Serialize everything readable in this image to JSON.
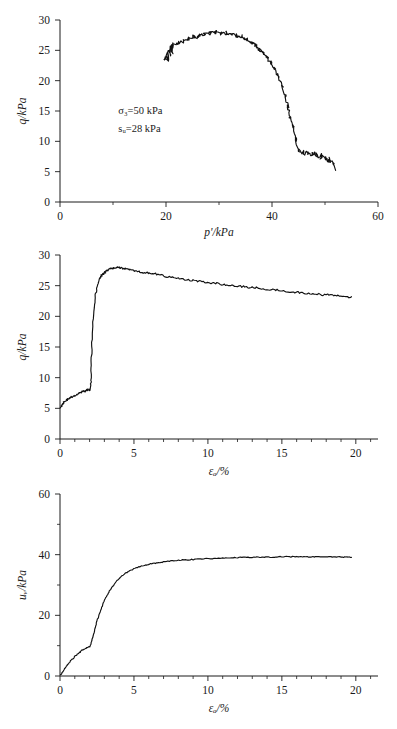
{
  "figure": {
    "name": "triaxial-test-results",
    "panel_count": 3
  },
  "chart_data": [
    {
      "id": "stress-path",
      "type": "line",
      "title": "",
      "xlabel": "p'/kPa",
      "ylabel": "q/kPa",
      "xlim": [
        0,
        60
      ],
      "ylim": [
        0,
        30
      ],
      "xticks": [
        0,
        20,
        40,
        60
      ],
      "xticks_minor": [
        10,
        30,
        50
      ],
      "yticks": [
        0,
        5,
        10,
        15,
        20,
        25,
        30
      ],
      "grid": false,
      "legend": "none",
      "annotations": [
        {
          "text": "σ₃=50 kPa",
          "x": 11,
          "y": 14.5
        },
        {
          "text": "sᵤ=28 kPa",
          "x": 11,
          "y": 11.5
        }
      ],
      "series": [
        {
          "name": "effective stress path",
          "x": [
            19.6,
            19.9,
            20.3,
            20.1,
            20.6,
            20.4,
            21.0,
            20.7,
            21.3,
            21.1,
            21.0,
            20.6,
            20.9,
            21.4,
            21.2,
            21.8,
            22.4,
            22.1,
            22.9,
            23.4,
            23.1,
            23.9,
            24.4,
            24.1,
            24.9,
            25.4,
            25.1,
            25.9,
            26.4,
            26.1,
            26.9,
            27.4,
            27.2,
            27.9,
            28.4,
            28.2,
            28.9,
            29.4,
            29.2,
            29.9,
            30.4,
            30.2,
            30.9,
            31.4,
            31.2,
            31.9,
            32.4,
            32.2,
            32.9,
            33.4,
            33.2,
            33.9,
            34.4,
            34.2,
            34.9,
            35.4,
            35.2,
            35.9,
            36.3,
            36.1,
            36.7,
            37.1,
            36.9,
            37.4,
            37.8,
            37.6,
            38.1,
            38.5,
            38.3,
            38.8,
            39.2,
            39.0,
            39.5,
            39.9,
            39.7,
            40.2,
            40.6,
            40.4,
            40.9,
            41.3,
            41.1,
            41.6,
            42.0,
            41.8,
            42.3,
            42.6,
            42.4,
            42.8,
            43.1,
            42.9,
            43.3,
            43.6,
            43.4,
            43.8,
            44.1,
            43.9,
            44.3,
            44.6,
            44.4,
            44.9,
            45.3,
            45.1,
            45.7,
            46.1,
            45.9,
            46.5,
            46.9,
            46.7,
            47.3,
            47.7,
            47.5,
            48.1,
            48.5,
            48.3,
            48.9,
            49.3,
            49.1,
            49.7,
            50.1,
            49.9,
            50.5,
            50.9,
            50.7,
            51.3,
            51.7,
            51.5,
            52.0
          ],
          "y": [
            23.4,
            24.2,
            23.0,
            24.8,
            23.6,
            25.1,
            24.0,
            25.6,
            24.4,
            25.9,
            25.2,
            24.6,
            25.8,
            25.3,
            26.2,
            25.8,
            26.3,
            25.9,
            26.6,
            26.4,
            26.9,
            26.7,
            27.0,
            26.8,
            27.2,
            27.0,
            27.4,
            27.2,
            27.5,
            27.3,
            27.6,
            27.5,
            27.8,
            27.6,
            27.9,
            27.7,
            28.0,
            27.8,
            28.1,
            27.9,
            28.0,
            27.8,
            27.9,
            27.7,
            27.9,
            27.6,
            27.8,
            27.5,
            27.6,
            27.3,
            27.5,
            27.2,
            27.3,
            27.0,
            27.0,
            26.7,
            26.9,
            26.4,
            26.2,
            26.5,
            25.9,
            25.6,
            25.9,
            25.3,
            25.0,
            25.3,
            24.7,
            24.3,
            24.6,
            24.0,
            23.6,
            23.9,
            23.2,
            22.8,
            23.1,
            22.3,
            21.8,
            22.1,
            21.2,
            20.6,
            20.9,
            19.8,
            19.1,
            19.4,
            18.2,
            17.3,
            17.6,
            16.4,
            15.5,
            15.8,
            14.6,
            13.8,
            14.0,
            13.0,
            12.4,
            12.6,
            11.4,
            10.2,
            10.6,
            8.8,
            8.2,
            8.6,
            7.9,
            8.4,
            7.8,
            8.3,
            7.7,
            8.2,
            7.6,
            8.1,
            7.5,
            8.0,
            7.4,
            7.9,
            7.3,
            7.8,
            7.2,
            7.6,
            7.0,
            7.4,
            6.8,
            7.2,
            6.5,
            6.9,
            6.2,
            6.5,
            5.8,
            5.2
          ]
        }
      ]
    },
    {
      "id": "deviator-stress-vs-strain",
      "type": "line",
      "title": "",
      "xlabel": "εₐ/%",
      "ylabel": "q/kPa",
      "xlim": [
        0,
        21.5
      ],
      "ylim": [
        0,
        30
      ],
      "xticks": [
        0,
        5,
        10,
        15,
        20
      ],
      "xtick_minor_step": 1,
      "yticks": [
        0,
        5,
        10,
        15,
        20,
        25,
        30
      ],
      "grid": false,
      "legend": "none",
      "series": [
        {
          "name": "deviator stress q",
          "x": [
            0.05,
            0.15,
            0.25,
            0.4,
            0.55,
            0.7,
            0.85,
            1.0,
            1.15,
            1.3,
            1.45,
            1.6,
            1.7,
            1.8,
            1.9,
            2.0,
            2.05,
            2.1,
            2.12,
            2.15,
            2.2,
            2.3,
            2.4,
            2.5,
            2.6,
            2.7,
            2.8,
            2.9,
            3.0,
            3.1,
            3.2,
            3.35,
            3.5,
            3.7,
            3.9,
            4.1,
            4.3,
            4.5,
            4.8,
            5.1,
            5.4,
            5.8,
            6.2,
            6.6,
            7.0,
            7.5,
            8.0,
            8.5,
            9.0,
            9.5,
            10.0,
            10.5,
            11.0,
            11.5,
            12.0,
            12.5,
            13.0,
            13.5,
            14.0,
            14.5,
            15.0,
            15.5,
            16.0,
            16.5,
            17.0,
            17.5,
            18.0,
            18.5,
            19.0,
            19.4,
            19.7
          ],
          "y": [
            5.2,
            5.6,
            6.0,
            6.3,
            6.5,
            6.7,
            6.9,
            7.1,
            7.3,
            7.5,
            7.7,
            7.9,
            7.8,
            8.0,
            8.1,
            8.0,
            8.2,
            9.5,
            12.0,
            15.0,
            18.5,
            21.5,
            23.5,
            24.8,
            25.6,
            26.2,
            26.6,
            26.9,
            27.1,
            27.3,
            27.5,
            27.7,
            27.8,
            27.9,
            28.0,
            27.9,
            27.8,
            27.7,
            27.6,
            27.4,
            27.3,
            27.1,
            27.0,
            26.8,
            26.6,
            26.4,
            26.2,
            26.0,
            25.9,
            25.7,
            25.5,
            25.4,
            25.2,
            25.0,
            24.9,
            24.8,
            24.7,
            24.6,
            24.4,
            24.3,
            24.2,
            24.0,
            23.9,
            23.8,
            23.7,
            23.6,
            23.5,
            23.4,
            23.3,
            23.2,
            23.2
          ]
        }
      ]
    },
    {
      "id": "pore-water-pressure-vs-strain",
      "type": "line",
      "title": "",
      "xlabel": "εₐ/%",
      "ylabel": "uᵥ/kPa",
      "xlim": [
        0,
        21.5
      ],
      "ylim": [
        0,
        60
      ],
      "xticks": [
        0,
        5,
        10,
        15,
        20
      ],
      "xtick_minor_step": 1,
      "yticks": [
        0,
        20,
        40,
        60
      ],
      "yticks_minor": [
        10,
        30,
        50
      ],
      "grid": false,
      "legend": "none",
      "series": [
        {
          "name": "pore water pressure u_w",
          "x": [
            0.05,
            0.2,
            0.4,
            0.6,
            0.8,
            1.0,
            1.2,
            1.4,
            1.6,
            1.8,
            2.0,
            2.1,
            2.2,
            2.35,
            2.5,
            2.7,
            2.9,
            3.1,
            3.3,
            3.5,
            3.8,
            4.1,
            4.4,
            4.7,
            5.0,
            5.4,
            5.8,
            6.2,
            6.6,
            7.0,
            7.5,
            8.0,
            8.5,
            9.0,
            9.5,
            10.0,
            10.5,
            11.0,
            11.5,
            12.0,
            12.5,
            13.0,
            13.5,
            14.0,
            14.5,
            15.0,
            15.5,
            16.0,
            16.5,
            17.0,
            17.5,
            18.0,
            18.5,
            19.0,
            19.4,
            19.7
          ],
          "y": [
            0.4,
            1.6,
            3.0,
            4.3,
            5.4,
            6.4,
            7.3,
            8.1,
            8.8,
            9.3,
            9.7,
            10.6,
            12.6,
            15.4,
            18.0,
            21.0,
            23.6,
            25.8,
            27.6,
            29.2,
            31.1,
            32.6,
            33.8,
            34.7,
            35.4,
            36.1,
            36.6,
            37.0,
            37.3,
            37.6,
            37.9,
            38.1,
            38.3,
            38.4,
            38.6,
            38.7,
            38.8,
            38.9,
            38.9,
            39.0,
            39.1,
            39.1,
            39.2,
            39.2,
            39.2,
            39.3,
            39.3,
            39.3,
            39.3,
            39.3,
            39.3,
            39.3,
            39.3,
            39.2,
            39.2,
            39.1
          ]
        }
      ]
    }
  ]
}
